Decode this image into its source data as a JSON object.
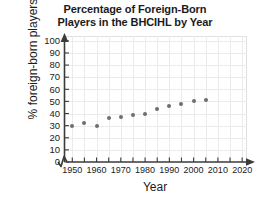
{
  "chart_data": {
    "type": "scatter",
    "title": "Percentage of Foreign-Born Players in the BHCIHL by Year",
    "title_lines": [
      "Percentage of Foreign-Born",
      "Players in the BHCIHL by Year"
    ],
    "xlabel": "Year",
    "ylabel": "% foreign-born players",
    "x": [
      1950,
      1955,
      1960,
      1965,
      1970,
      1975,
      1980,
      1985,
      1990,
      1995,
      2000,
      2005
    ],
    "values": [
      30,
      32,
      30,
      36.5,
      37.5,
      38.5,
      40,
      44,
      46,
      48,
      50,
      51
    ],
    "xlim": [
      1947,
      2022
    ],
    "ylim": [
      0,
      104
    ],
    "xticks": [
      1950,
      1955,
      1960,
      1965,
      1970,
      1975,
      1980,
      1985,
      1990,
      1995,
      2000,
      2005,
      2010,
      2015,
      2020
    ],
    "xtick_labels": [
      "1950",
      "1960",
      "1970",
      "1980",
      "1990",
      "2000",
      "2010",
      "2020"
    ],
    "xtick_label_values": [
      1950,
      1960,
      1970,
      1980,
      1990,
      2000,
      2010,
      2020
    ],
    "yticks": [
      0,
      10,
      20,
      30,
      40,
      50,
      60,
      70,
      80,
      90,
      100
    ],
    "ytick_labels": [
      "0",
      "10",
      "20",
      "30",
      "40",
      "50",
      "60",
      "70",
      "80",
      "90",
      "100"
    ],
    "grid": true,
    "legend": false,
    "axis_break_x": true,
    "marker_color": "#6d6e71",
    "grid_color": "#ebebeb",
    "axis_color": "#3b3b3b",
    "text_color": "#1b1b1b",
    "background": "#ffffff"
  }
}
